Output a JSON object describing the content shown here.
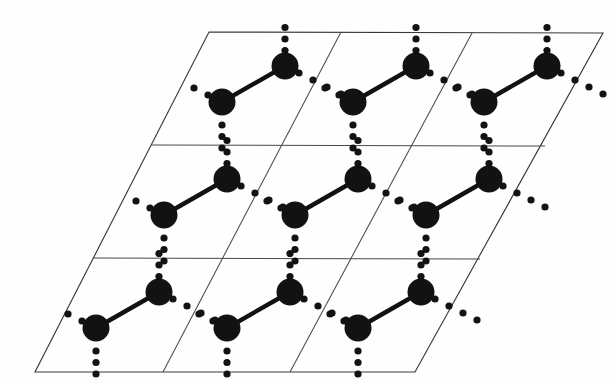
{
  "figure": {
    "title": "Two-dimensional lattice of a layered structure",
    "type": "crystal-lattice-diagram",
    "background_color": "#fefefe",
    "line_color": "#3a3a3a",
    "atom_color": "#121212",
    "bond_color": "#111111",
    "dot_color": "#121212"
  },
  "geometry": {
    "canvas": {
      "width": 615,
      "height": 384
    },
    "parallelogram": {
      "top_left": {
        "x": 209,
        "y": 32
      },
      "top_right": {
        "x": 603,
        "y": 33
      },
      "bottom_right": {
        "x": 415,
        "y": 372
      },
      "bottom_left": {
        "x": 35,
        "y": 372
      },
      "rows": 3,
      "columns": 3,
      "row_shift": {
        "x": -58,
        "y": 113
      },
      "column_shift": {
        "x": 131,
        "y": 0
      }
    },
    "horizontal_dividers": [
      {
        "x1": 151,
        "y1": 145,
        "x2": 545,
        "y2": 146
      },
      {
        "x1": 93,
        "y1": 258,
        "x2": 480,
        "y2": 259
      }
    ],
    "slanted_dividers": [
      {
        "x1": 341,
        "y1": 32,
        "x2": 163,
        "y2": 372
      },
      {
        "x1": 472,
        "y1": 33,
        "x2": 290,
        "y2": 372
      }
    ]
  },
  "atom": {
    "radius": 13.5,
    "label": "lattice-atom",
    "count_visible": 18
  },
  "dot": {
    "radius": 3.6,
    "spacing": 11.5,
    "label": "weak-contact-dot"
  },
  "bond": {
    "width": 4.4,
    "label": "covalent-bond",
    "count_visible": 9
  },
  "motif": {
    "comment": "One cell motif relative to the cell's reference origin; the upper atom sits up-right of the lower atom.",
    "upper_atom_offset": {
      "x": 76,
      "y": 34
    },
    "lower_atom_offset": {
      "x": 13,
      "y": 70
    },
    "cells": [
      {
        "row": 0,
        "col": 0,
        "upper": {
          "x": 285,
          "y": 66
        },
        "lower": {
          "x": 222,
          "y": 102
        }
      },
      {
        "row": 0,
        "col": 1,
        "upper": {
          "x": 416,
          "y": 66
        },
        "lower": {
          "x": 353,
          "y": 102
        }
      },
      {
        "row": 0,
        "col": 2,
        "upper": {
          "x": 547,
          "y": 66
        },
        "lower": {
          "x": 484,
          "y": 102
        }
      },
      {
        "row": 1,
        "col": 0,
        "upper": {
          "x": 227,
          "y": 179
        },
        "lower": {
          "x": 164,
          "y": 215
        }
      },
      {
        "row": 1,
        "col": 1,
        "upper": {
          "x": 358,
          "y": 179
        },
        "lower": {
          "x": 295,
          "y": 215
        }
      },
      {
        "row": 1,
        "col": 2,
        "upper": {
          "x": 489,
          "y": 179
        },
        "lower": {
          "x": 426,
          "y": 215
        }
      },
      {
        "row": 2,
        "col": 0,
        "upper": {
          "x": 159,
          "y": 292
        },
        "lower": {
          "x": 96,
          "y": 328
        }
      },
      {
        "row": 2,
        "col": 1,
        "upper": {
          "x": 290,
          "y": 292
        },
        "lower": {
          "x": 227,
          "y": 328
        }
      },
      {
        "row": 2,
        "col": 2,
        "upper": {
          "x": 421,
          "y": 292
        },
        "lower": {
          "x": 358,
          "y": 328
        }
      }
    ]
  },
  "dotted_chains": {
    "comment": "Per-cell dotted contacts. 'up' runs vertically up from the upper atom, 'down' runs vertically down from the lower atom, 'diag' runs down-right from the upper atom toward the next cell's lower atom, and 'diag_in' arrives at the lower atom from the upper-left.",
    "up_from_upper": {
      "dx": 0,
      "dy": -11.5,
      "count": 3
    },
    "down_from_lower": {
      "dx": 0,
      "dy": 11.5,
      "count": 3
    },
    "diag_from_upper": {
      "dx": 14,
      "dy": 7,
      "count": 4
    },
    "diag_into_lower": {
      "dx": -14,
      "dy": -7,
      "count": 2
    }
  }
}
